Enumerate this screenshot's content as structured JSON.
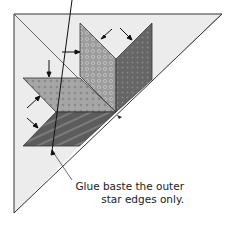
{
  "caption": {
    "line1": "Glue baste the outer",
    "line2": "star edges only."
  },
  "colors": {
    "background_triangle": "#ececec",
    "diamond_light": "#a8a8a8",
    "diamond_medium": "#9a9a9a",
    "diamond_dark": "#6a6a6a",
    "diamond_darkest": "#555555",
    "outline": "#333333"
  }
}
